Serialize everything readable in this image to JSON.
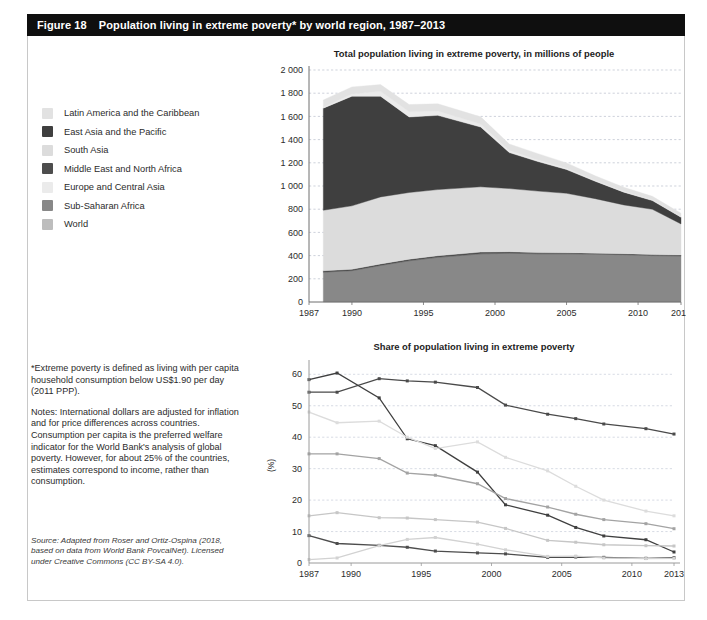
{
  "figure": {
    "number": "Figure 18",
    "title": "Population living in extreme poverty* by world region, 1987–2013"
  },
  "legend": {
    "items": [
      {
        "label": "Latin America and the Caribbean",
        "color": "#e2e2e2"
      },
      {
        "label": "East Asia and the Pacific",
        "color": "#3f3f3f"
      },
      {
        "label": "South Asia",
        "color": "#dcdcdc"
      },
      {
        "label": "Middle East and North Africa",
        "color": "#4d4d4d"
      },
      {
        "label": "Europe and Central Asia",
        "color": "#ebebeb"
      },
      {
        "label": "Sub-Saharan Africa",
        "color": "#888888"
      },
      {
        "label": "World",
        "color": "#bdbdbd"
      }
    ]
  },
  "notes": {
    "footnote": "*Extreme poverty is defined as living with per capita household consumption below US$1.90 per day (2011 PPP).",
    "note": "Notes: International dollars are adjusted for inflation and for price differences across countries. Consumption per capita is the preferred welfare indicator for the World Bank's analysis of global poverty. However, for about 25% of the countries, estimates correspond to income, rather than consumption.",
    "source": "Source: Adapted from Roser and Ortiz-Ospina (2018, based on data from World Bank PovcalNet). Licensed under Creative Commons (CC BY-SA 4.0)."
  },
  "chart_data": [
    {
      "id": "total-population",
      "type": "area",
      "title": "Total population living in extreme poverty, in millions of people",
      "xlabel": "",
      "ylabel": "",
      "xlim": [
        1987,
        2013
      ],
      "ylim": [
        0,
        2000
      ],
      "xticks": [
        1987,
        1990,
        1995,
        2000,
        2005,
        2010,
        2013
      ],
      "yticks": [
        "0",
        "200",
        "400",
        "600",
        "800",
        "1 000",
        "1 200",
        "1 400",
        "1 600",
        "1 800",
        "2 000"
      ],
      "grid": true,
      "legend_position": "external-left",
      "stacked": true,
      "x": [
        1988,
        1990,
        1992,
        1994,
        1996,
        1999,
        2001,
        2003,
        2005,
        2007,
        2009,
        2011,
        2013
      ],
      "series": [
        {
          "name": "Sub-Saharan Africa",
          "color": "#888888",
          "values": [
            257,
            270,
            315,
            355,
            385,
            415,
            420,
            415,
            415,
            412,
            408,
            400,
            396
          ]
        },
        {
          "name": "Middle East and North Africa",
          "color": "#4d4d4d",
          "values": [
            12,
            12,
            13,
            14,
            14,
            15,
            13,
            11,
            10,
            9,
            9,
            9,
            9
          ]
        },
        {
          "name": "South Asia",
          "color": "#dcdcdc",
          "values": [
            522,
            547,
            578,
            575,
            570,
            563,
            545,
            530,
            512,
            470,
            420,
            390,
            268
          ]
        },
        {
          "name": "East Asia and the Pacific",
          "color": "#3f3f3f",
          "values": [
            880,
            945,
            868,
            651,
            640,
            515,
            310,
            255,
            205,
            150,
            110,
            75,
            58
          ]
        },
        {
          "name": "Europe and Central Asia",
          "color": "#ebebeb",
          "values": [
            8,
            20,
            42,
            45,
            38,
            26,
            18,
            14,
            11,
            9,
            8,
            7,
            6
          ]
        },
        {
          "name": "Latin America and the Caribbean",
          "color": "#e2e2e2",
          "values": [
            62,
            60,
            58,
            62,
            62,
            62,
            56,
            54,
            46,
            38,
            34,
            30,
            28
          ]
        }
      ]
    },
    {
      "id": "share-population",
      "type": "line",
      "title": "Share of population living in extreme poverty",
      "xlabel": "",
      "ylabel": "(%)",
      "xlim": [
        1987,
        2013
      ],
      "ylim": [
        0,
        62
      ],
      "xticks": [
        1987,
        1990,
        1995,
        2000,
        2005,
        2010,
        2013
      ],
      "yticks": [
        0,
        10,
        20,
        30,
        40,
        50,
        60
      ],
      "grid": true,
      "legend_position": "external-left",
      "x": [
        1987,
        1989,
        1992,
        1994,
        1996,
        1999,
        2001,
        2004,
        2006,
        2008,
        2011,
        2013
      ],
      "series": [
        {
          "name": "Sub-Saharan Africa",
          "color": "#4a4a4a",
          "values": [
            54.3,
            54.3,
            58.6,
            57.9,
            57.5,
            55.8,
            50.2,
            47.3,
            45.9,
            44.2,
            42.7,
            41.0
          ]
        },
        {
          "name": "East Asia and the Pacific",
          "color": "#3f3f3f",
          "values": [
            58.3,
            60.4,
            52.5,
            39.5,
            37.3,
            28.9,
            18.5,
            15.2,
            11.3,
            8.6,
            7.4,
            3.5
          ]
        },
        {
          "name": "South Asia",
          "color": "#dcdcdc",
          "values": [
            48.0,
            44.6,
            45.1,
            40.0,
            36.4,
            38.5,
            33.6,
            29.3,
            24.4,
            20.0,
            16.5,
            15.0
          ]
        },
        {
          "name": "World",
          "color": "#a3a3a3",
          "values": [
            34.7,
            34.7,
            33.2,
            28.6,
            27.9,
            25.2,
            20.5,
            17.8,
            15.5,
            13.8,
            12.5,
            10.9
          ]
        },
        {
          "name": "Latin America and the Caribbean",
          "color": "#c6c6c6",
          "values": [
            15.0,
            16.0,
            14.4,
            14.3,
            13.8,
            13.0,
            11.0,
            7.2,
            6.6,
            5.8,
            5.5,
            5.4
          ]
        },
        {
          "name": "Middle East and North Africa",
          "color": "#4d4d4d",
          "values": [
            8.7,
            6.2,
            5.6,
            5.0,
            3.8,
            3.2,
            2.9,
            1.8,
            1.9,
            1.8,
            1.5,
            1.7
          ]
        },
        {
          "name": "Europe and Central Asia",
          "color": "#d2d2d2",
          "values": [
            1.1,
            1.6,
            5.5,
            7.5,
            8.1,
            6.0,
            4.2,
            2.1,
            2.2,
            1.6,
            1.4,
            1.5
          ]
        }
      ]
    }
  ]
}
